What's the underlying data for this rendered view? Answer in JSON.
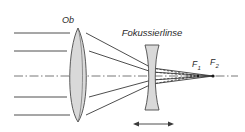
{
  "figure": {
    "language": "de",
    "background_color": "#ffffff",
    "width": 245,
    "height": 132
  },
  "labels": {
    "objective": "Ob",
    "focusing_lens": "Fokussierlinse",
    "focal_point_1": "F",
    "focal_point_1_sub": "1",
    "focal_point_2": "F",
    "focal_point_2_sub": "2"
  },
  "colors": {
    "lens_fill": "#d9d9d9",
    "lens_stroke": "#4a4a4a",
    "ray_stroke": "#3a3a3a",
    "axis_stroke": "#555555",
    "text": "#2a2a2a"
  },
  "optics": {
    "objective_lens": {
      "type": "biconvex-doublet",
      "center_x": 78,
      "top_y": 28,
      "bottom_y": 122,
      "half_thickness": 12
    },
    "focusing_lens": {
      "type": "biconcave",
      "center_x": 152,
      "top_y": 45,
      "bottom_y": 110,
      "half_thickness": 5,
      "adjustable": true
    },
    "optical_axis_y": 76,
    "focal_points": [
      {
        "name": "F1",
        "x": 198,
        "y": 76
      },
      {
        "name": "F2",
        "x": 213,
        "y": 76
      }
    ],
    "incoming_rays": [
      {
        "y": 33,
        "x_start": 14
      },
      {
        "y": 51,
        "x_start": 14
      },
      {
        "y": 76,
        "x_start": 14,
        "is_axis": true
      },
      {
        "y": 97,
        "x_start": 14
      },
      {
        "y": 115,
        "x_start": 14
      }
    ],
    "adjustment_arrow": {
      "y": 124,
      "x_start": 133,
      "x_end": 174,
      "double_headed": true
    }
  }
}
